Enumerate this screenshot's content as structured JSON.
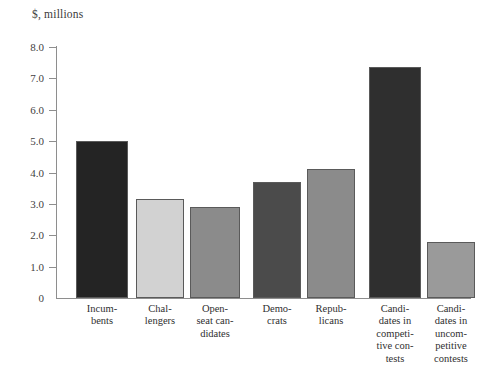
{
  "chart_data": {
    "type": "bar",
    "title": "$, millions",
    "xlabel": "",
    "ylabel": "$, millions",
    "ylim": [
      0,
      8.0
    ],
    "grid": false,
    "legend": "none",
    "y_ticks": [
      "8.0",
      "7.0",
      "6.0",
      "5.0",
      "4.0",
      "3.0",
      "2.0",
      "1.0",
      "0"
    ],
    "y_tick_values": [
      8.0,
      7.0,
      6.0,
      5.0,
      4.0,
      3.0,
      2.0,
      1.0,
      0
    ],
    "categories": [
      "Incumbents",
      "Challengers",
      "Open-seat candidates",
      "Democrats",
      "Republicans",
      "Candidates in competitive contests",
      "Candidates in uncompetitive contests"
    ],
    "category_label_lines": [
      [
        "Incum-",
        "bents"
      ],
      [
        "Chal-",
        "lengers"
      ],
      [
        "Open-",
        "seat can-",
        "didates"
      ],
      [
        "Demo-",
        "crats"
      ],
      [
        "Repub-",
        "licans"
      ],
      [
        "Candi-",
        "dates in",
        "competi-",
        "tive con-",
        "tests"
      ],
      [
        "Candi-",
        "dates in",
        "uncom-",
        "petitive",
        "contests"
      ]
    ],
    "values": [
      5.0,
      3.15,
      2.9,
      3.7,
      4.1,
      7.35,
      1.8
    ],
    "bar_colors": [
      "#242424",
      "#d2d2d2",
      "#8b8b8b",
      "#4b4b4b",
      "#8b8b8b",
      "#2f2f2f",
      "#9a9a9a"
    ],
    "groups": [
      {
        "name": "candidate-status",
        "categories": [
          "Incumbents",
          "Challengers",
          "Open-seat candidates"
        ]
      },
      {
        "name": "party",
        "categories": [
          "Democrats",
          "Republicans"
        ]
      },
      {
        "name": "contest-competitiveness",
        "categories": [
          "Candidates in competitive contests",
          "Candidates in uncompetitive contests"
        ]
      }
    ],
    "axis_color": "#8e8e8e",
    "bar_border_color": "#5a5a5a",
    "background": "#ffffff"
  }
}
